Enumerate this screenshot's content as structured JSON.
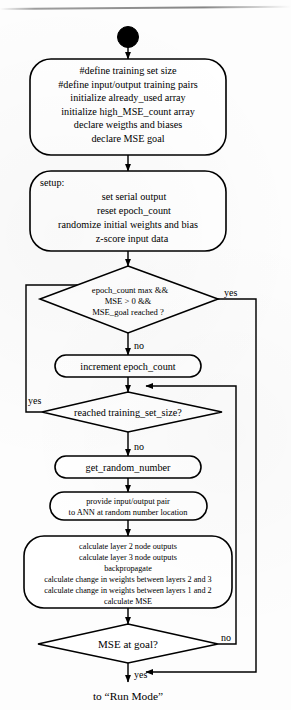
{
  "diagram": {
    "type": "flowchart",
    "stroke_color": "#000000",
    "fill_color": "#ffffff",
    "nodes": [
      {
        "id": "start",
        "shape": "filled-circle",
        "label": ""
      },
      {
        "id": "declarations",
        "shape": "rounded-rectangle",
        "align": "center",
        "lines": [
          "#define training set size",
          "#define input/output training pairs",
          "initialize already_used array",
          "initialize high_MSE_count array",
          "declare weigths and biases",
          "declare MSE goal"
        ]
      },
      {
        "id": "setup",
        "shape": "rounded-rectangle",
        "align": "mixed",
        "heading": "setup:",
        "lines": [
          "set serial output",
          "reset epoch_count",
          "randomize initial weights and bias",
          "z-score input data"
        ]
      },
      {
        "id": "epoch-decision",
        "shape": "diamond",
        "lines": [
          "epoch_count max  &&",
          "MSE > 0  &&",
          "MSE_goal reached ?"
        ]
      },
      {
        "id": "increment-epoch",
        "shape": "stadium",
        "lines": [
          "increment epoch_count"
        ]
      },
      {
        "id": "training-set-decision",
        "shape": "diamond",
        "lines": [
          "reached training_set_size?"
        ]
      },
      {
        "id": "get-random-number",
        "shape": "stadium",
        "lines": [
          "get_random_number"
        ]
      },
      {
        "id": "provide-pair",
        "shape": "stadium",
        "lines": [
          "provide input/output pair",
          "to ANN at random number location"
        ]
      },
      {
        "id": "calculate-block",
        "shape": "rounded-rectangle",
        "align": "center",
        "lines": [
          "calculate layer 2 node outputs",
          "calculate layer 3 node outputs",
          "backpropagate",
          "calculate change in weights between layers 2 and 3",
          "calculate change in weights between layers 1 and 2",
          "calculate MSE"
        ]
      },
      {
        "id": "mse-goal-decision",
        "shape": "diamond",
        "lines": [
          "MSE at goal?"
        ]
      },
      {
        "id": "run-mode-terminal",
        "shape": "text",
        "lines": [
          "to “Run Mode”"
        ]
      }
    ],
    "edge_labels": {
      "epoch_yes": "yes",
      "epoch_no": "no",
      "training_yes": "yes",
      "training_no": "no",
      "mse_no": "no",
      "mse_yes": "yes"
    }
  }
}
